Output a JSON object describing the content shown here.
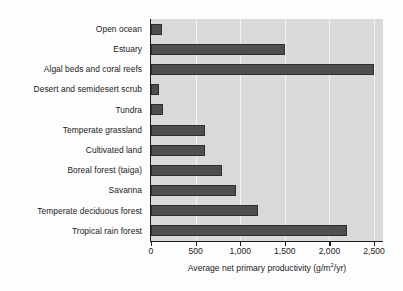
{
  "chart_data": {
    "type": "bar",
    "orientation": "horizontal",
    "title": "",
    "xlabel": "Average net primary productivity (g/m2/yr)",
    "xlabel_parts": {
      "before": "Average net primary productivity (g/m",
      "superscript": "2",
      "after": "/yr)"
    },
    "ylabel": "",
    "xlim": [
      0,
      2600
    ],
    "xticks": [
      0,
      500,
      1000,
      1500,
      2000,
      2500
    ],
    "xticklabels": [
      "0",
      "500",
      "1,000",
      "1,500",
      "2,000",
      "2,500"
    ],
    "grid": "vertical",
    "legend": "none",
    "categories": [
      "Open ocean",
      "Estuary",
      "Algal beds and coral reefs",
      "Desert and semidesert scrub",
      "Tundra",
      "Temperate grassland",
      "Cultivated land",
      "Boreal forest (taiga)",
      "Savanna",
      "Temperate deciduous forest",
      "Tropical rain forest"
    ],
    "values": [
      125,
      1500,
      2500,
      90,
      140,
      600,
      600,
      800,
      950,
      1200,
      2200
    ],
    "colors": {
      "bar_fill": "#4e4e4e",
      "bar_edge": "#2e2e2e",
      "plot_background": "#d9d9d9",
      "gridline": "#f2f2f2",
      "axis": "#1b1b1b",
      "text": "#1b1b1b",
      "figure_background": "#fdfdfd"
    }
  }
}
